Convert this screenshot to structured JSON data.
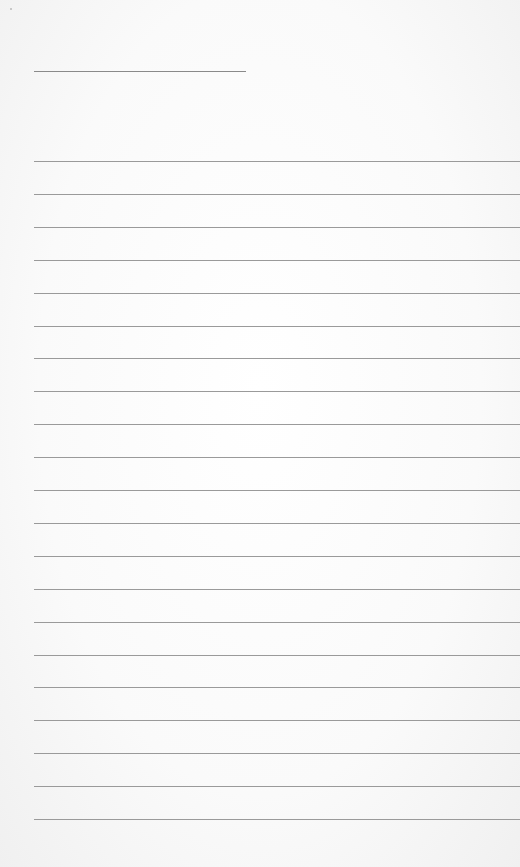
{
  "document": {
    "type": "lined-paper",
    "title_line": {
      "left": 34,
      "top": 71,
      "width": 212
    },
    "rules": {
      "count": 21,
      "first_top": 161,
      "spacing": 32.9,
      "left": 34
    },
    "colors": {
      "background": "#f6f6f6",
      "rule": "#9a9a9a",
      "title_line": "#8a8a8a"
    }
  }
}
